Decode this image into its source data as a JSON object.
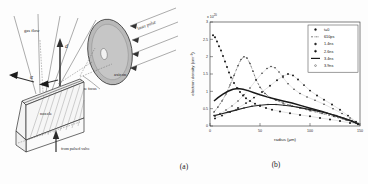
{
  "figure": {
    "panel_a": {
      "caption": "(a)",
      "labels": {
        "gas_flow": "gas flow",
        "d": "d",
        "alpha": "α",
        "laser_pulse": "laser pulse",
        "axicon": "axicon",
        "line_focus": "line focus",
        "nozzle": "nozzle",
        "from_pulsed_valve": "from pulsed valve"
      }
    },
    "panel_b": {
      "caption": "(b)"
    }
  },
  "chart_data": {
    "type": "scatter",
    "title": "",
    "xlabel": "radius  (μm)",
    "ylabel": "electron density  (cm⁻³)",
    "exponent_label": "x 10",
    "exponent_power": "20",
    "xlim": [
      0,
      150
    ],
    "ylim": [
      0,
      3.0
    ],
    "xticks": [
      0,
      50,
      100,
      150
    ],
    "xticklabels": [
      "0",
      "50",
      "100",
      "150"
    ],
    "yticks": [
      0,
      0.5,
      1.0,
      1.5,
      2.0,
      2.5,
      3.0
    ],
    "yticklabels": [
      "0",
      "0.5",
      "1",
      "1.5",
      "2",
      "2.5",
      "3"
    ],
    "grid": false,
    "legend_position": "upper right",
    "series": [
      {
        "name": "t=0",
        "marker": "dot",
        "color": "#141414",
        "points": [
          [
            3,
            2.62
          ],
          [
            5,
            2.56
          ],
          [
            7,
            2.44
          ],
          [
            9,
            2.3
          ],
          [
            11,
            2.18
          ],
          [
            13,
            2.02
          ],
          [
            15,
            1.86
          ],
          [
            17,
            1.7
          ],
          [
            19,
            1.54
          ],
          [
            21,
            1.4
          ],
          [
            24,
            1.24
          ],
          [
            27,
            1.1
          ],
          [
            30,
            0.98
          ],
          [
            33,
            0.88
          ],
          [
            36,
            0.8
          ],
          [
            40,
            0.72
          ],
          [
            45,
            0.64
          ],
          [
            50,
            0.58
          ],
          [
            56,
            0.52
          ],
          [
            62,
            0.47
          ],
          [
            70,
            0.42
          ],
          [
            80,
            0.37
          ],
          [
            90,
            0.32
          ],
          [
            100,
            0.28
          ],
          [
            110,
            0.23
          ],
          [
            120,
            0.19
          ],
          [
            130,
            0.14
          ],
          [
            140,
            0.09
          ],
          [
            148,
            0.05
          ]
        ]
      },
      {
        "name": "610ps",
        "marker": "dash-dot",
        "color": "#2a2a2a",
        "points": [
          [
            4,
            0.4
          ],
          [
            8,
            0.55
          ],
          [
            12,
            0.72
          ],
          [
            16,
            0.92
          ],
          [
            20,
            1.18
          ],
          [
            24,
            1.46
          ],
          [
            28,
            1.74
          ],
          [
            31,
            1.92
          ],
          [
            34,
            2.0
          ],
          [
            37,
            1.96
          ],
          [
            40,
            1.8
          ],
          [
            43,
            1.58
          ],
          [
            46,
            1.34
          ],
          [
            50,
            1.12
          ],
          [
            55,
            0.94
          ],
          [
            60,
            0.82
          ],
          [
            66,
            0.74
          ],
          [
            73,
            0.66
          ],
          [
            80,
            0.6
          ],
          [
            90,
            0.52
          ],
          [
            100,
            0.44
          ],
          [
            112,
            0.36
          ],
          [
            124,
            0.27
          ],
          [
            136,
            0.17
          ],
          [
            148,
            0.06
          ]
        ]
      },
      {
        "name": "1.4ns",
        "marker": "dot-small",
        "color": "#1f1f1f",
        "points": [
          [
            5,
            0.28
          ],
          [
            10,
            0.36
          ],
          [
            16,
            0.46
          ],
          [
            22,
            0.58
          ],
          [
            28,
            0.72
          ],
          [
            34,
            0.9
          ],
          [
            40,
            1.1
          ],
          [
            46,
            1.32
          ],
          [
            52,
            1.52
          ],
          [
            57,
            1.66
          ],
          [
            61,
            1.72
          ],
          [
            65,
            1.68
          ],
          [
            69,
            1.56
          ],
          [
            73,
            1.4
          ],
          [
            78,
            1.22
          ],
          [
            84,
            1.06
          ],
          [
            90,
            0.94
          ],
          [
            97,
            0.84
          ],
          [
            105,
            0.74
          ],
          [
            114,
            0.63
          ],
          [
            123,
            0.5
          ],
          [
            132,
            0.36
          ],
          [
            140,
            0.23
          ],
          [
            148,
            0.08
          ]
        ]
      },
      {
        "name": "2.6ns",
        "marker": "dot-med",
        "color": "#101010",
        "points": [
          [
            5,
            0.22
          ],
          [
            12,
            0.3
          ],
          [
            20,
            0.4
          ],
          [
            28,
            0.52
          ],
          [
            36,
            0.66
          ],
          [
            44,
            0.82
          ],
          [
            52,
            0.98
          ],
          [
            60,
            1.16
          ],
          [
            67,
            1.32
          ],
          [
            73,
            1.44
          ],
          [
            78,
            1.5
          ],
          [
            83,
            1.46
          ],
          [
            88,
            1.34
          ],
          [
            94,
            1.18
          ],
          [
            100,
            1.02
          ],
          [
            107,
            0.88
          ],
          [
            114,
            0.76
          ],
          [
            122,
            0.62
          ],
          [
            130,
            0.47
          ],
          [
            138,
            0.3
          ],
          [
            146,
            0.12
          ]
        ]
      },
      {
        "name": "3.4ns",
        "marker": "line",
        "color": "#181818",
        "points": [
          [
            4,
            0.72
          ],
          [
            8,
            0.82
          ],
          [
            13,
            0.92
          ],
          [
            18,
            1.0
          ],
          [
            23,
            1.06
          ],
          [
            28,
            1.08
          ],
          [
            33,
            1.06
          ],
          [
            38,
            1.02
          ],
          [
            44,
            0.96
          ],
          [
            50,
            0.9
          ],
          [
            57,
            0.84
          ],
          [
            65,
            0.78
          ],
          [
            73,
            0.72
          ],
          [
            82,
            0.66
          ],
          [
            92,
            0.58
          ],
          [
            102,
            0.5
          ],
          [
            112,
            0.42
          ],
          [
            122,
            0.33
          ],
          [
            132,
            0.24
          ],
          [
            141,
            0.15
          ],
          [
            148,
            0.06
          ]
        ]
      },
      {
        "name": "3.9ns",
        "marker": "circle",
        "color": "#222222",
        "points": [
          [
            4,
            0.3
          ],
          [
            10,
            0.34
          ],
          [
            18,
            0.4
          ],
          [
            26,
            0.46
          ],
          [
            34,
            0.52
          ],
          [
            42,
            0.57
          ],
          [
            50,
            0.6
          ],
          [
            58,
            0.62
          ],
          [
            66,
            0.62
          ],
          [
            74,
            0.6
          ],
          [
            82,
            0.57
          ],
          [
            90,
            0.53
          ],
          [
            99,
            0.48
          ],
          [
            108,
            0.43
          ],
          [
            117,
            0.37
          ],
          [
            126,
            0.3
          ],
          [
            134,
            0.22
          ],
          [
            142,
            0.14
          ],
          [
            149,
            0.05
          ]
        ]
      }
    ]
  }
}
